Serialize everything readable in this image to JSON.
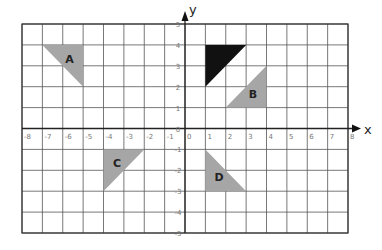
{
  "chart_data": {
    "type": "coordinate-grid",
    "title": "",
    "xlabel": "x",
    "ylabel": "y",
    "xlim": [
      -8,
      8
    ],
    "ylim": [
      -5,
      5
    ],
    "grid": true,
    "x_ticks": [
      "-8",
      "-7",
      "-6",
      "-5",
      "-4",
      "-3",
      "-2",
      "-1",
      "0",
      "1",
      "2",
      "3",
      "4",
      "5",
      "6",
      "7",
      "8"
    ],
    "y_ticks": [
      "5",
      "4",
      "3",
      "2",
      "1",
      "0",
      "-1",
      "-2",
      "-3",
      "-4",
      "-5"
    ],
    "shapes": [
      {
        "name": "object",
        "label": "",
        "color": "#111111",
        "vertices": [
          [
            1,
            4
          ],
          [
            3,
            4
          ],
          [
            1,
            2
          ]
        ]
      },
      {
        "name": "A",
        "label": "A",
        "color": "#a6a6a6",
        "vertices": [
          [
            -7,
            4
          ],
          [
            -5,
            4
          ],
          [
            -5,
            2
          ]
        ]
      },
      {
        "name": "B",
        "label": "B",
        "color": "#a6a6a6",
        "vertices": [
          [
            4,
            3
          ],
          [
            4,
            1
          ],
          [
            2,
            1
          ]
        ]
      },
      {
        "name": "C",
        "label": "C",
        "color": "#a6a6a6",
        "vertices": [
          [
            -4,
            -1
          ],
          [
            -2,
            -1
          ],
          [
            -4,
            -3
          ]
        ]
      },
      {
        "name": "D",
        "label": "D",
        "color": "#a6a6a6",
        "vertices": [
          [
            1,
            -1
          ],
          [
            1,
            -3
          ],
          [
            3,
            -3
          ]
        ]
      }
    ]
  },
  "colors": {
    "grid": "#555555",
    "image_fill": "#a6a6a6",
    "object_fill": "#111111"
  }
}
